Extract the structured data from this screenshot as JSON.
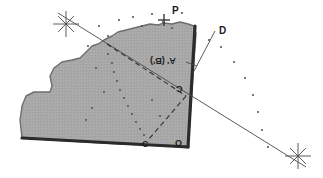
{
  "figure": {
    "type": "geometric-survey-diagram",
    "width": 323,
    "height": 178,
    "background_color": "#ffffff"
  },
  "colors": {
    "parcel_fill": "#a8a8a8",
    "parcel_fill_light": "#b2b2b2",
    "parcel_outline": "#6e6e6e",
    "heavy_edge": "#2b2b2b",
    "line": "#4a4a4a",
    "dash": "#2f2f2f",
    "dot": "#555555",
    "label_text": "#1c1c1c"
  },
  "labels": [
    {
      "id": "P",
      "text": "P",
      "x": 172,
      "y": 6,
      "size": 10,
      "flipped": false,
      "name": "label-point-p"
    },
    {
      "id": "D",
      "text": "D",
      "x": 219,
      "y": 26,
      "size": 10,
      "flipped": false,
      "name": "label-point-d"
    },
    {
      "id": "AB",
      "text": "A' (B')",
      "x": 150,
      "y": 56,
      "size": 9,
      "flipped": true,
      "name": "label-point-a-prime-b-prime"
    },
    {
      "id": "Cmid",
      "text": "C",
      "x": 176,
      "y": 84,
      "size": 9,
      "flipped": true,
      "name": "label-point-c-upper"
    },
    {
      "id": "Cbot",
      "text": "C",
      "x": 142,
      "y": 140,
      "size": 9,
      "flipped": false,
      "name": "label-point-c-lower"
    },
    {
      "id": "O",
      "text": "O",
      "x": 175,
      "y": 139,
      "size": 9,
      "flipped": false,
      "name": "label-point-o"
    }
  ],
  "markers": {
    "stars": [
      {
        "id": "star-top-left",
        "x": 66,
        "y": 24,
        "r": 13,
        "name": "station-star-top-left"
      },
      {
        "id": "star-bottom-right",
        "x": 298,
        "y": 156,
        "r": 13,
        "name": "station-star-bottom-right"
      }
    ],
    "cross": {
      "id": "cross-p",
      "x": 164,
      "y": 20,
      "r": 6,
      "name": "survey-cross-p"
    }
  },
  "dot_fields": {
    "top_scatter": [
      [
        99,
        26
      ],
      [
        119,
        20
      ],
      [
        133,
        17
      ],
      [
        152,
        14
      ],
      [
        163,
        22
      ],
      [
        182,
        13
      ],
      [
        108,
        36
      ],
      [
        142,
        26
      ],
      [
        172,
        28
      ]
    ],
    "right_arc": [
      [
        209,
        40
      ],
      [
        221,
        47
      ],
      [
        234,
        62
      ],
      [
        245,
        78
      ],
      [
        253,
        95
      ],
      [
        258,
        112
      ],
      [
        262,
        130
      ],
      [
        268,
        147
      ]
    ],
    "interior_trail": [
      [
        108,
        54
      ],
      [
        112,
        63
      ],
      [
        114,
        72
      ],
      [
        117,
        81
      ],
      [
        120,
        90
      ],
      [
        124,
        98
      ],
      [
        128,
        106
      ],
      [
        132,
        114
      ],
      [
        136,
        122
      ],
      [
        140,
        129
      ],
      [
        144,
        135
      ]
    ],
    "misc": [
      [
        88,
        46
      ],
      [
        96,
        68
      ],
      [
        104,
        92
      ],
      [
        92,
        108
      ],
      [
        86,
        120
      ],
      [
        152,
        100
      ],
      [
        160,
        116
      ]
    ]
  },
  "shapes": {
    "parcel_path": "M 22,138 L 20,120 L 22,106 L 26,96 L 34,92 L 44,92 L 50,92 L 52,86 L 50,76 L 54,68 L 62,62 L 72,60 L 80,58 L 86,52 L 92,46 L 98,44 L 104,40 L 112,36 L 118,32 L 126,30 L 134,28 L 142,26 L 150,24 L 158,25 L 164,23 L 172,24 L 180,22 L 188,24 L 194,26 L 196,34 L 194,60 L 192,90 L 190,118 L 188,146 L 120,144 L 70,141 Z",
    "heavy_right_edge": {
      "x1": 195,
      "y1": 26,
      "x2": 188,
      "y2": 147
    },
    "heavy_bottom_edge": {
      "x1": 22,
      "y1": 138,
      "x2": 188,
      "y2": 147
    }
  },
  "lines": {
    "sight_line_main": {
      "x1": 58,
      "y1": 13,
      "x2": 306,
      "y2": 167,
      "name": "sight-line-station-to-station"
    },
    "dashed_upper": {
      "x1": 107,
      "y1": 44,
      "x2": 186,
      "y2": 96,
      "name": "dashed-line-upper"
    },
    "dashed_lower": {
      "x1": 186,
      "y1": 96,
      "x2": 149,
      "y2": 139,
      "name": "dashed-line-lower"
    },
    "leader_d": {
      "x1": 215,
      "y1": 31,
      "x2": 193,
      "y2": 73,
      "name": "leader-line-to-d"
    },
    "leader_ab": {
      "x1": 186,
      "y1": 62,
      "x2": 197,
      "y2": 66,
      "name": "leader-line-to-a-prime"
    }
  }
}
